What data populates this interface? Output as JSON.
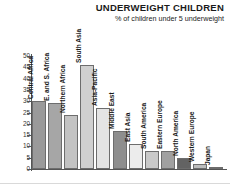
{
  "chart_data": {
    "type": "bar",
    "title": "UNDERWEIGHT CHILDREN",
    "subtitle": "% of children under 5 underweight",
    "xlabel": "",
    "ylabel": "",
    "ylim": [
      0,
      50
    ],
    "ytick_step": 5,
    "grid": false,
    "legend": "none",
    "orientation": "vertical",
    "yticks": [
      "50",
      "45",
      "40",
      "35",
      "30",
      "25",
      "20",
      "15",
      "10",
      "5",
      "0"
    ],
    "categories": [
      "Central Africa",
      "E. and S. Africa",
      "Northern Africa",
      "South Asia",
      "Asia-Pacific",
      "Middle East",
      "East Asia",
      "South America",
      "Eastern Europe",
      "North America",
      "Western Europe",
      "Japan"
    ],
    "values": [
      30,
      29,
      24,
      46,
      27,
      17,
      11,
      8,
      8,
      5,
      2,
      1
    ],
    "bar_colors": [
      "#9a9a9a",
      "#a6a6a6",
      "#c3c3c3",
      "#d0d0d0",
      "#e4e4e4",
      "#8e8e8e",
      "#ececec",
      "#c9c9c9",
      "#a0a0a0",
      "#636363",
      "#bdbdbd",
      "#e0e0e0"
    ]
  },
  "colors": {
    "axis": "#555555",
    "text": "#1a1a1a",
    "background": "#ffffff"
  }
}
